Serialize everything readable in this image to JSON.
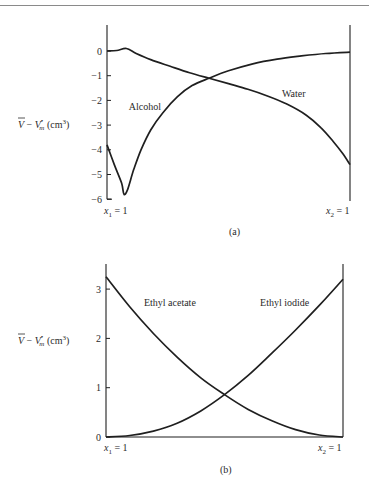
{
  "page": {
    "rule_color": "#8a8a8a"
  },
  "chart_data": [
    {
      "id": "a",
      "type": "line",
      "caption": "(a)",
      "title": "",
      "ylabel": "V̄ − V•m (cm³)",
      "ylabel_parts": {
        "vbar": "V",
        "minus": " − ",
        "v": "V",
        "sup": "•",
        "sub": "m",
        "unit": " (cm",
        "unit_sup": "3",
        "close": ")"
      },
      "xlabel_left": {
        "var": "x",
        "sub": "1",
        "eq": " = 1"
      },
      "xlabel_right": {
        "var": "x",
        "sub": "2",
        "eq": " = 1"
      },
      "x_range": [
        0,
        1
      ],
      "x_meaning": "mole fraction x2 from x1=1 (left) to x2=1 (right)",
      "ylim": [
        -6,
        0.9
      ],
      "yticks": [
        0,
        -1,
        -2,
        -3,
        -4,
        -5,
        -6
      ],
      "ytick_labels": [
        "0",
        "−1",
        "−2",
        "−3",
        "−4",
        "−5",
        "−6"
      ],
      "grid": false,
      "legend": "inline labels",
      "series": [
        {
          "name": "Water",
          "label_pos": [
            0.72,
            -1.85
          ],
          "points": [
            [
              0,
              0
            ],
            [
              0.04,
              0.02
            ],
            [
              0.08,
              0.1
            ],
            [
              0.12,
              -0.1
            ],
            [
              0.18,
              -0.35
            ],
            [
              0.26,
              -0.62
            ],
            [
              0.34,
              -0.88
            ],
            [
              0.42,
              -1.1
            ],
            [
              0.5,
              -1.32
            ],
            [
              0.58,
              -1.55
            ],
            [
              0.66,
              -1.82
            ],
            [
              0.74,
              -2.15
            ],
            [
              0.82,
              -2.6
            ],
            [
              0.88,
              -3.1
            ],
            [
              0.93,
              -3.65
            ],
            [
              0.97,
              -4.15
            ],
            [
              1.0,
              -4.6
            ]
          ]
        },
        {
          "name": "Alcohol",
          "label_pos": [
            0.09,
            -2.4
          ],
          "points": [
            [
              0,
              -3.8
            ],
            [
              0.03,
              -4.6
            ],
            [
              0.06,
              -5.35
            ],
            [
              0.07,
              -5.8
            ],
            [
              0.085,
              -5.6
            ],
            [
              0.11,
              -4.8
            ],
            [
              0.14,
              -4.0
            ],
            [
              0.18,
              -3.2
            ],
            [
              0.23,
              -2.5
            ],
            [
              0.29,
              -1.85
            ],
            [
              0.35,
              -1.4
            ],
            [
              0.42,
              -1.1
            ],
            [
              0.5,
              -0.8
            ],
            [
              0.6,
              -0.52
            ],
            [
              0.7,
              -0.33
            ],
            [
              0.8,
              -0.2
            ],
            [
              0.9,
              -0.1
            ],
            [
              1.0,
              -0.05
            ]
          ]
        }
      ]
    },
    {
      "id": "b",
      "type": "line",
      "caption": "(b)",
      "title": "",
      "ylabel": "V̄ − V•m (cm³)",
      "ylabel_parts": {
        "vbar": "V",
        "minus": " − ",
        "v": "V",
        "sup": "•",
        "sub": "m",
        "unit": " (cm",
        "unit_sup": "3",
        "close": ")"
      },
      "xlabel_left": {
        "var": "x",
        "sub": "1",
        "eq": " = 1"
      },
      "xlabel_right": {
        "var": "x",
        "sub": "2",
        "eq": " = 1"
      },
      "x_range": [
        0,
        1
      ],
      "x_meaning": "mole fraction x2 from x1=1 (left) to x2=1 (right)",
      "ylim": [
        0,
        3.5
      ],
      "yticks": [
        0,
        1,
        2,
        3
      ],
      "ytick_labels": [
        "0",
        "1",
        "2",
        "3"
      ],
      "grid": false,
      "legend": "inline labels",
      "series": [
        {
          "name": "Ethyl acetate",
          "label_pos": [
            0.16,
            2.65
          ],
          "points": [
            [
              0,
              3.25
            ],
            [
              0.1,
              2.64
            ],
            [
              0.2,
              2.1
            ],
            [
              0.3,
              1.62
            ],
            [
              0.4,
              1.2
            ],
            [
              0.5,
              0.86
            ],
            [
              0.6,
              0.56
            ],
            [
              0.7,
              0.33
            ],
            [
              0.8,
              0.15
            ],
            [
              0.9,
              0.04
            ],
            [
              1.0,
              0.0
            ]
          ]
        },
        {
          "name": "Ethyl iodide",
          "label_pos": [
            0.65,
            2.65
          ],
          "points": [
            [
              0,
              0.0
            ],
            [
              0.1,
              0.03
            ],
            [
              0.2,
              0.12
            ],
            [
              0.3,
              0.28
            ],
            [
              0.4,
              0.53
            ],
            [
              0.5,
              0.86
            ],
            [
              0.6,
              1.25
            ],
            [
              0.7,
              1.7
            ],
            [
              0.8,
              2.17
            ],
            [
              0.9,
              2.67
            ],
            [
              1.0,
              3.2
            ]
          ]
        }
      ]
    }
  ]
}
